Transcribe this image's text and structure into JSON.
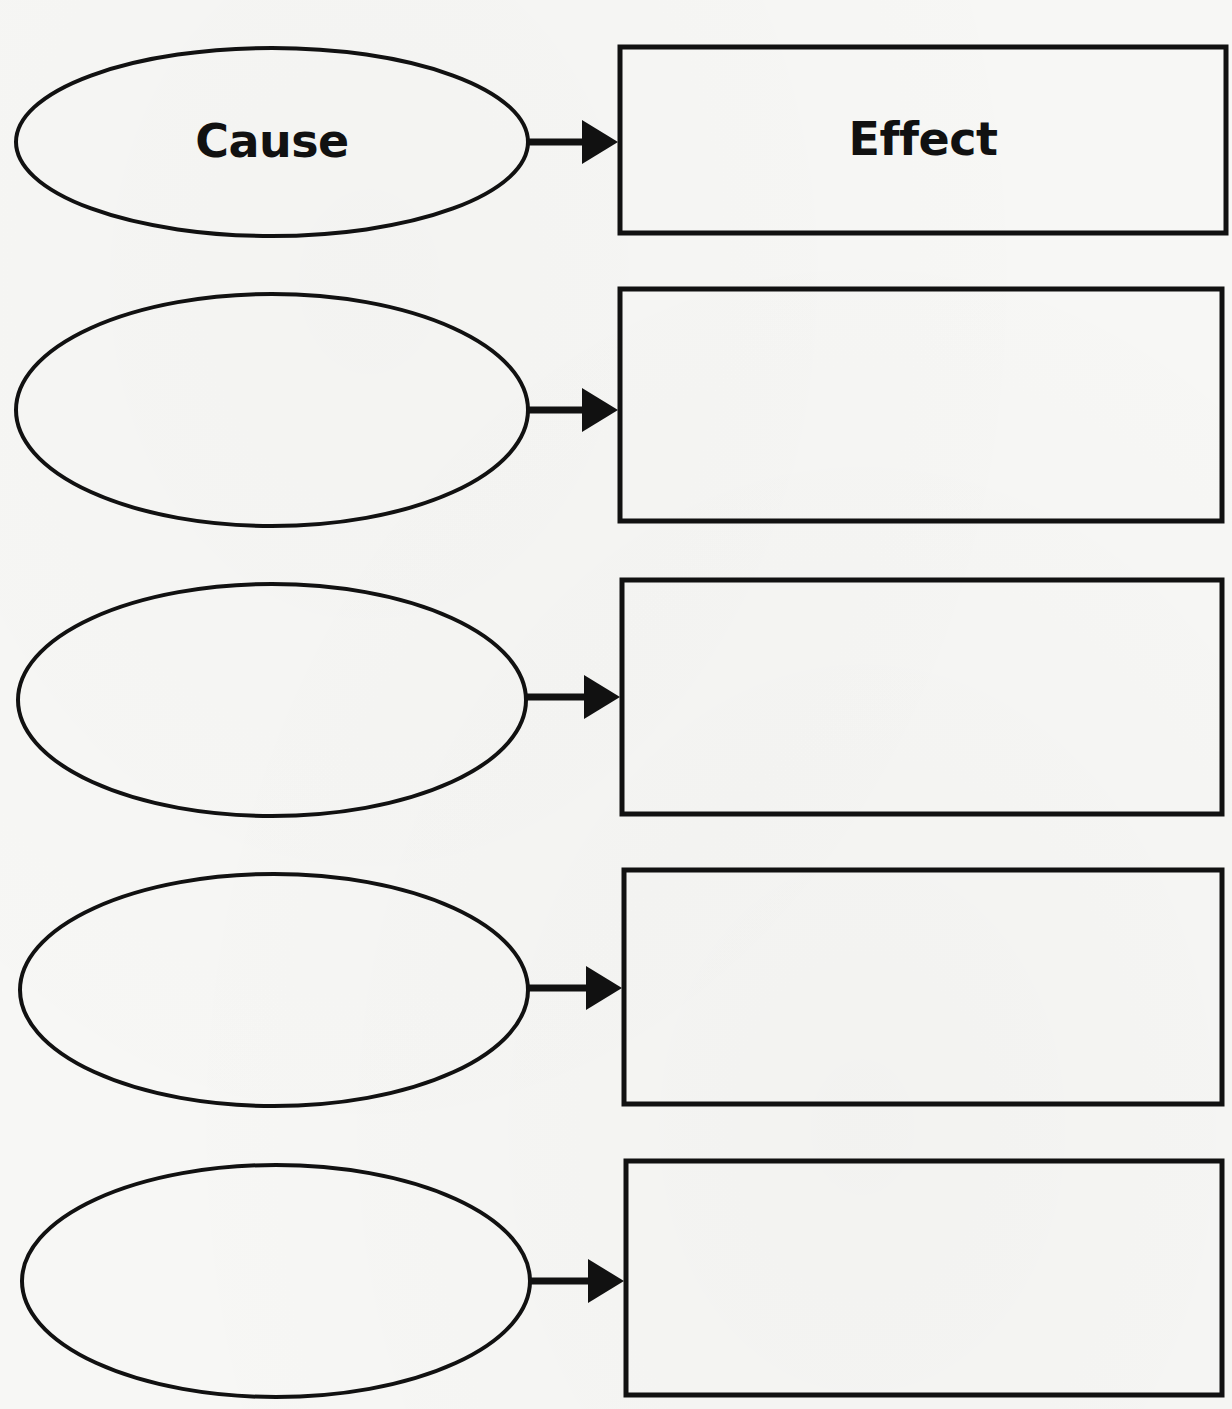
{
  "worksheet": {
    "header_label_cause": "Cause",
    "header_label_effect": "Effect",
    "stroke_color": "#111111",
    "background_color": "#f7f7f5",
    "rows": [
      {
        "index": 1,
        "cause_text": "Cause",
        "effect_text": "Effect",
        "ellipse": {
          "cx": 272,
          "cy": 142,
          "rx": 256,
          "ry": 94
        },
        "box": {
          "x": 620,
          "y": 47,
          "w": 606,
          "h": 186
        },
        "arrow_y": 142
      },
      {
        "index": 2,
        "cause_text": "",
        "effect_text": "",
        "ellipse": {
          "cx": 272,
          "cy": 410,
          "rx": 256,
          "ry": 116
        },
        "box": {
          "x": 620,
          "y": 289,
          "w": 602,
          "h": 232
        },
        "arrow_y": 410
      },
      {
        "index": 3,
        "cause_text": "",
        "effect_text": "",
        "ellipse": {
          "cx": 272,
          "cy": 700,
          "rx": 254,
          "ry": 116
        },
        "box": {
          "x": 622,
          "y": 580,
          "w": 600,
          "h": 234
        },
        "arrow_y": 697
      },
      {
        "index": 4,
        "cause_text": "",
        "effect_text": "",
        "ellipse": {
          "cx": 274,
          "cy": 990,
          "rx": 254,
          "ry": 116
        },
        "box": {
          "x": 624,
          "y": 870,
          "w": 598,
          "h": 234
        },
        "arrow_y": 988
      },
      {
        "index": 5,
        "cause_text": "",
        "effect_text": "",
        "ellipse": {
          "cx": 276,
          "cy": 1281,
          "rx": 254,
          "ry": 116
        },
        "box": {
          "x": 626,
          "y": 1161,
          "w": 596,
          "h": 234
        },
        "arrow_y": 1281
      }
    ]
  }
}
